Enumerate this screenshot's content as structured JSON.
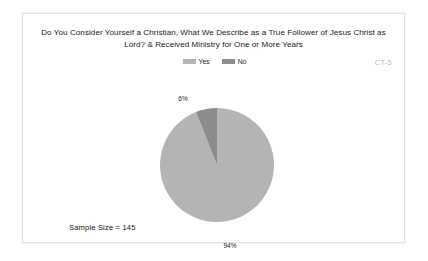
{
  "slide": {
    "title": "Do You Consider Yourself a Christian, What We Describe as a True Follower of Jesus Christ as Lord? & Received Ministry for One or More Years",
    "corner_code": "CT-5",
    "sample_size_text": "Sample Size = 145"
  },
  "chart_data": {
    "type": "pie",
    "title": "Do You Consider Yourself a Christian, What We Describe as a True Follower of Jesus Christ as Lord? & Received Ministry for One or More Years",
    "categories": [
      "Yes",
      "No"
    ],
    "values": [
      94,
      6
    ],
    "value_labels": [
      "94%",
      "6%"
    ],
    "unit": "percent",
    "sample_size": 145,
    "legend": {
      "position": "top-center",
      "entries": [
        {
          "label": "Yes",
          "color": "#b4b4b4"
        },
        {
          "label": "No",
          "color": "#8c8c8c"
        }
      ]
    },
    "slices": [
      {
        "name": "Yes",
        "value": 94,
        "label": "94%",
        "color": "#b4b4b4",
        "label_position": "bottom"
      },
      {
        "name": "No",
        "value": 6,
        "label": "6%",
        "color": "#8c8c8c",
        "label_position": "top-left"
      }
    ],
    "start_angle_deg": 0,
    "direction": "counterclockwise",
    "grid": false,
    "xlabel": "",
    "ylabel": ""
  }
}
